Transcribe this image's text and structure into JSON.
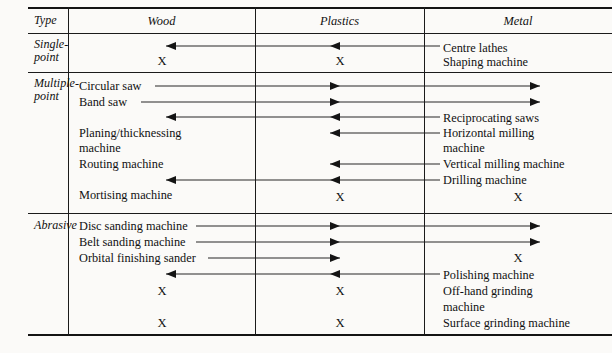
{
  "table": {
    "caption_fragment": "",
    "columns": [
      {
        "id": "type",
        "label": "Type"
      },
      {
        "id": "wood",
        "label": "Wood"
      },
      {
        "id": "plastics",
        "label": "Plastics"
      },
      {
        "id": "metal",
        "label": "Metal"
      }
    ],
    "sections": [
      {
        "id": "single-point",
        "type_label_line1": "Single-",
        "type_label_line2": "point",
        "wood_entries": [],
        "wood_marks": [
          "X"
        ],
        "plastics_marks": [
          "X"
        ],
        "metal_entries": [
          "Centre lathes",
          "Shaping machine"
        ]
      },
      {
        "id": "multiple-point",
        "type_label_line1": "Multiple-",
        "type_label_line2": "point",
        "wood_entries": [
          "Circular saw",
          "Band saw",
          "Planing/thicknessing",
          "machine",
          "Routing machine",
          "Mortising machine"
        ],
        "wood_marks": [],
        "plastics_marks": [
          "X"
        ],
        "metal_entries": [
          "Reciprocating saws",
          "Horizontal milling",
          "machine",
          "Vertical milling machine",
          "Drilling machine"
        ],
        "metal_marks": [
          "X"
        ]
      },
      {
        "id": "abrasive",
        "type_label_line1": "Abrasive",
        "type_label_line2": "",
        "wood_entries": [
          "Disc sanding machine",
          "Belt sanding machine",
          "Orbital finishing sander"
        ],
        "wood_marks": [
          "X",
          "X"
        ],
        "plastics_marks": [
          "X",
          "X"
        ],
        "metal_entries": [
          "Polishing machine",
          "Off-hand grinding",
          "machine",
          "Surface grinding machine"
        ],
        "metal_marks": [
          "X"
        ]
      }
    ]
  },
  "labels": {
    "type": "Type",
    "wood": "Wood",
    "plastics": "Plastics",
    "metal": "Metal",
    "single_1": "Single-",
    "single_2": "point",
    "multiple_1": "Multiple-",
    "multiple_2": "point",
    "abrasive": "Abrasive",
    "centre_lathes": "Centre lathes",
    "shaping_machine": "Shaping machine",
    "circular_saw": "Circular saw",
    "band_saw": "Band saw",
    "planing_1": "Planing/thicknessing",
    "planing_2": "machine",
    "routing_machine": "Routing machine",
    "mortising_machine": "Mortising machine",
    "reciprocating_saws": "Reciprocating saws",
    "horizontal_1": "Horizontal milling",
    "horizontal_2": "machine",
    "vertical_milling": "Vertical milling machine",
    "drilling_machine": "Drilling machine",
    "disc_sanding": "Disc sanding machine",
    "belt_sanding": "Belt sanding machine",
    "orbital_sander": "Orbital finishing sander",
    "polishing_machine": "Polishing machine",
    "offhand_1": "Off-hand grinding",
    "offhand_2": "machine",
    "surface_grinding": "Surface grinding machine",
    "x": "X"
  }
}
